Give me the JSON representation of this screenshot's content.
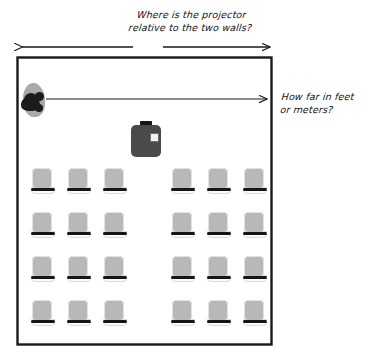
{
  "diagram": {
    "background_color": "#ffffff",
    "wall_color": "#1a1a1a",
    "arrow_color": "#1a1a1a",
    "seat_color": "#b8b8b8",
    "projector_color": "#4a4a4a",
    "presenter_color": "#1b1b1b"
  },
  "annotations": {
    "top_question": "Where is the projector\nrelative to the two walls?",
    "right_question": "How far in feet\nor meters?"
  },
  "room": {
    "label": "classroom-floor-plan",
    "x": 17,
    "y": 57,
    "width": 255,
    "height": 288
  },
  "measure_arrows": [
    {
      "name": "left-wall-measure-arrow",
      "direction": "left",
      "x1": 133,
      "y1": 47,
      "x2": 20,
      "y2": 47
    },
    {
      "name": "right-wall-measure-arrow",
      "direction": "right",
      "x1": 163,
      "y1": 47,
      "x2": 272,
      "y2": 47
    },
    {
      "name": "presenter-to-wall-distance-arrow",
      "direction": "right",
      "x1": 46,
      "y1": 99,
      "x2": 269,
      "y2": 99
    }
  ],
  "objects": {
    "presenter": {
      "name": "presenter-figure",
      "x": 19,
      "y": 83
    },
    "projector": {
      "name": "projector-device",
      "x": 131,
      "y": 121,
      "lens": "lens-window"
    }
  },
  "seating": {
    "rows": 4,
    "columns_per_block": 3,
    "blocks": 2,
    "total_seats": 24,
    "row_y": [
      168,
      212,
      256,
      300
    ],
    "left_block_x": [
      32,
      68,
      104
    ],
    "right_block_x": [
      172,
      208,
      244
    ]
  }
}
